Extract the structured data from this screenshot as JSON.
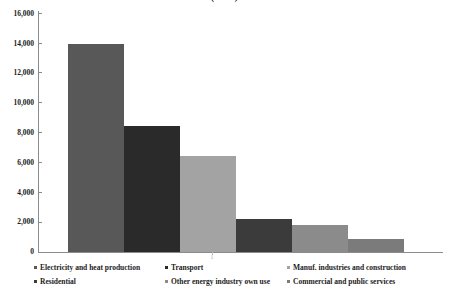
{
  "chart_data": {
    "type": "bar",
    "title": "(2011)",
    "xlabel": "",
    "ylabel": "",
    "ylim": [
      0,
      16000
    ],
    "ytick_labels": [
      "0",
      "2,000",
      "4,000",
      "6,000",
      "8,000",
      "10,000",
      "12,000",
      "14,000",
      "16,000"
    ],
    "ytick_values": [
      0,
      2000,
      4000,
      6000,
      8000,
      10000,
      12000,
      14000,
      16000
    ],
    "xtick_labels": [
      "1"
    ],
    "grid": false,
    "legend_position": "bottom",
    "categories": [
      "Electricity and heat production",
      "Transport",
      "Manuf. industries and construction",
      "Residential",
      "Other energy  industry own use",
      "Commercial and public services"
    ],
    "values": [
      13950,
      8430,
      6420,
      2200,
      1830,
      870
    ],
    "colors": [
      "#585858",
      "#2a2a2a",
      "#a3a3a3",
      "#3b3b3b",
      "#8b8b8b",
      "#7b7b7b"
    ],
    "series": [
      {
        "name": "Emissions",
        "values": [
          13950,
          8430,
          6420,
          2200,
          1830,
          870
        ]
      }
    ]
  },
  "legend": {
    "items": [
      {
        "label": "Electricity and heat production",
        "color": "#585858"
      },
      {
        "label": "Transport",
        "color": "#2a2a2a"
      },
      {
        "label": "Manuf. industries and construction",
        "color": "#a3a3a3"
      },
      {
        "label": "Residential",
        "color": "#3b3b3b"
      },
      {
        "label": "Other energy  industry own use",
        "color": "#8b8b8b"
      },
      {
        "label": "Commercial and public services",
        "color": "#7b7b7b"
      }
    ]
  }
}
